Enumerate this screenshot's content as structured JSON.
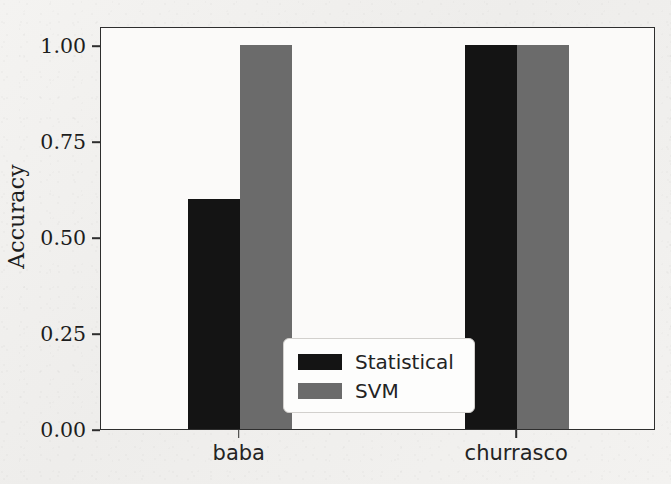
{
  "chart_data": {
    "type": "bar",
    "title": "",
    "xlabel": "",
    "ylabel": "Accuracy",
    "categories": [
      "baba",
      "churrasco"
    ],
    "series": [
      {
        "name": "Statistical",
        "color": "#141414",
        "values": [
          0.6,
          1.0
        ]
      },
      {
        "name": "SVM",
        "color": "#6b6b6b",
        "values": [
          1.0,
          1.0
        ]
      }
    ],
    "ylim": [
      0.0,
      1.05
    ],
    "yticks": [
      0.0,
      0.25,
      0.5,
      0.75,
      1.0
    ],
    "ytick_labels": [
      "0.00",
      "0.25",
      "0.50",
      "0.75",
      "1.00"
    ],
    "grid": false,
    "legend_position": "lower center"
  },
  "legend": {
    "entries": [
      {
        "label": "Statistical",
        "color": "#141414"
      },
      {
        "label": "SVM",
        "color": "#6b6b6b"
      }
    ]
  },
  "axes": {
    "frame_color": "#2e2e2e",
    "background": "#fbfaf9"
  }
}
